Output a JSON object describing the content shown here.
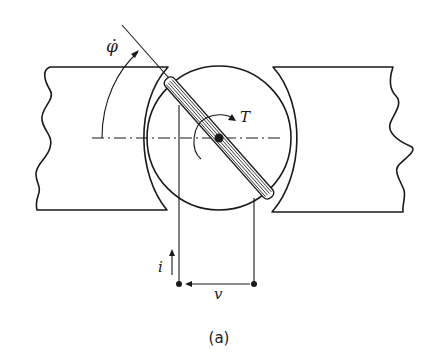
{
  "diagram": {
    "caption": "(a)",
    "labels": {
      "angular_velocity": "φ̇",
      "torque": "T",
      "current": "i",
      "voltage": "v"
    },
    "components": [
      "left-pole-piece",
      "right-pole-piece",
      "rotor",
      "rotor-coil",
      "terminal-left",
      "terminal-right"
    ],
    "colors": {
      "ink": "#1a1a1a",
      "background": "#ffffff"
    }
  }
}
